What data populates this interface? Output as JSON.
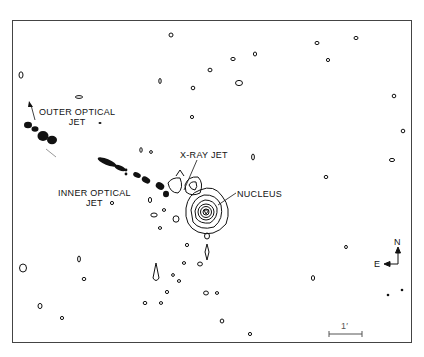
{
  "figure": {
    "type": "X-ray contour map with optical jet overlay",
    "labels": {
      "outer_optical_jet_line1": "OUTER OPTICAL",
      "outer_optical_jet_line2": "JET",
      "inner_optical_jet_line1": "INNER OPTICAL",
      "inner_optical_jet_line2": "JET",
      "xray_jet": "X-RAY JET",
      "nucleus": "NUCLEUS"
    },
    "compass": {
      "north": "N",
      "east": "E"
    },
    "scale_bar": {
      "label": "1′"
    },
    "colors": {
      "ink": "#111111",
      "frame": "#444444",
      "background": "#ffffff"
    }
  }
}
